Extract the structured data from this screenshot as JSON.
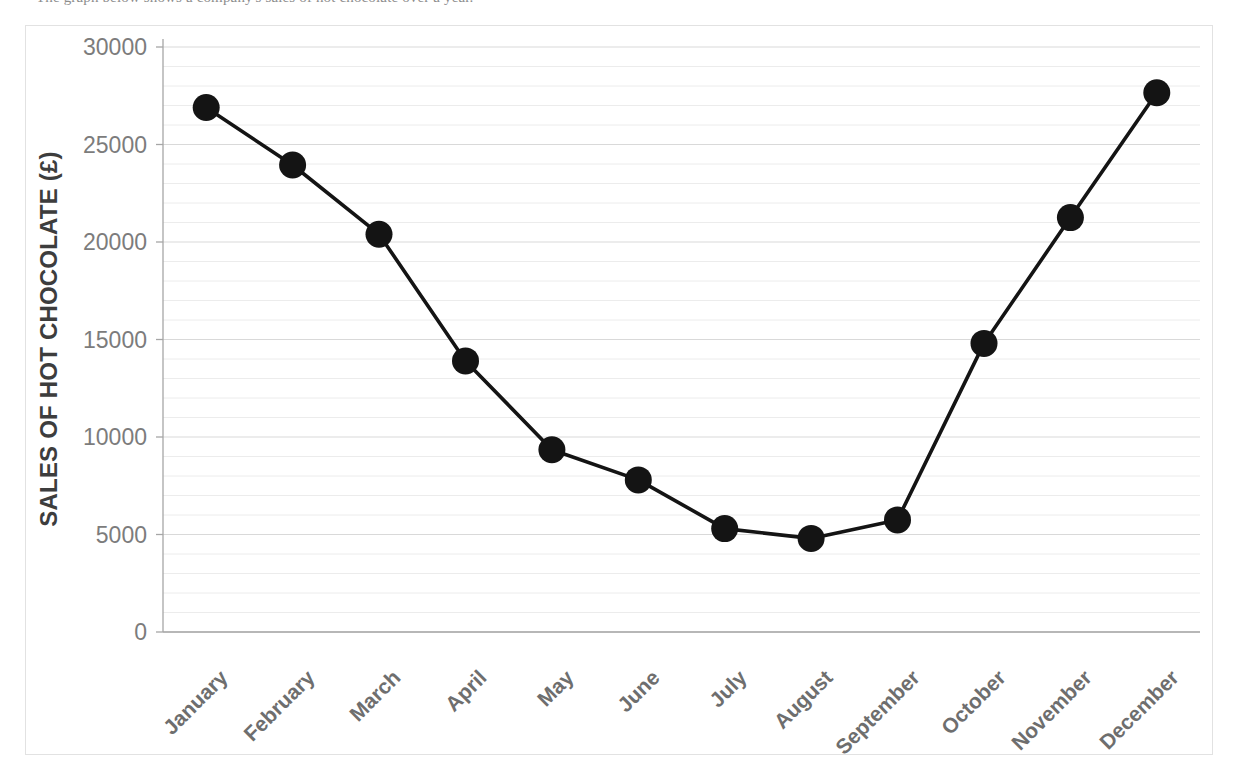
{
  "caption": {
    "text": "The graph below shows a company's sales of hot chocolate over a year."
  },
  "chart_data": {
    "type": "line",
    "title": "",
    "subtitle": "",
    "xlabel": "",
    "ylabel": "SALES OF HOT CHOCOLATE (£)",
    "categories": [
      "January",
      "February",
      "March",
      "April",
      "May",
      "June",
      "July",
      "August",
      "September",
      "October",
      "November",
      "December"
    ],
    "values": [
      26900,
      23950,
      20400,
      13900,
      9350,
      7800,
      5300,
      4800,
      5750,
      14800,
      21250,
      27650
    ],
    "series": [
      {
        "name": "Sales of hot chocolate",
        "values": [
          26900,
          23950,
          20400,
          13900,
          9350,
          7800,
          5300,
          4800,
          5750,
          14800,
          21250,
          27650
        ]
      }
    ],
    "ylim": [
      0,
      30000
    ],
    "y_ticks": [
      0,
      5000,
      10000,
      15000,
      20000,
      25000,
      30000
    ],
    "y_tick_labels": [
      "0",
      "5000",
      "10000",
      "15000",
      "20000",
      "25000",
      "30000"
    ],
    "minor_tick_interval": 1000,
    "grid": "horizontal-major-and-minor",
    "legend": "none",
    "marker": "filled-circle",
    "marker_color": "#141414",
    "line_color": "#141414",
    "axis_color": "#a6a6a6",
    "gridline_color": "#d9d9d9",
    "minor_gridline_color": "#ececec",
    "tick_label_color": "#7c7c7c",
    "axis_title_color": "#3d3d3d",
    "x_tick_rotation_deg": -45,
    "plot_area": {
      "left": 163,
      "right": 1200,
      "top": 47,
      "bottom": 632
    }
  }
}
